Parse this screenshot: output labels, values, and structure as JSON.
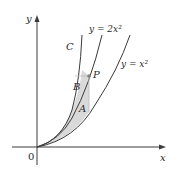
{
  "figure": {
    "axes": {
      "x_label": "x",
      "y_label": "y",
      "origin_label": "0"
    },
    "curves": [
      {
        "id": "C",
        "label": "C"
      },
      {
        "id": "y2x2",
        "label": "y = 2x²"
      },
      {
        "id": "yx2",
        "label": "y = x²"
      }
    ],
    "point": {
      "label": "P"
    },
    "regions": [
      {
        "id": "A",
        "label": "A"
      },
      {
        "id": "B",
        "label": "B"
      }
    ],
    "colors": {
      "shade": "#d9d9d9",
      "line": "#3a3a3a",
      "point": "#808080"
    }
  }
}
